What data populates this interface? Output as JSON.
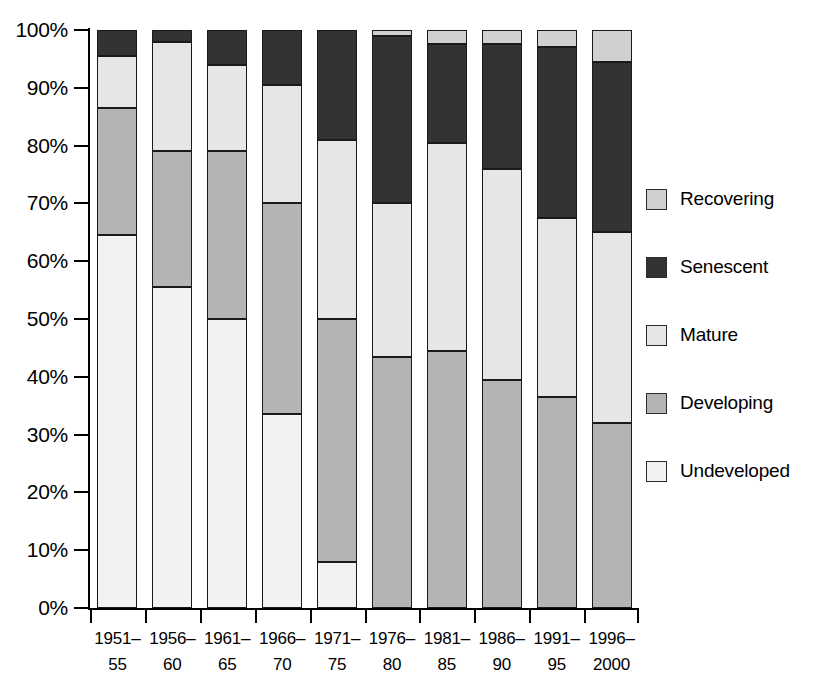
{
  "chart_data": {
    "type": "bar",
    "subtype": "stacked-bar-100-percent",
    "title": "",
    "subtitle": "",
    "xlabel": "",
    "ylabel": "",
    "ylim": [
      0,
      100
    ],
    "y_unit": "%",
    "grid": false,
    "legend_position": "right",
    "categories": [
      "1951-55",
      "1956-60",
      "1961-65",
      "1966-70",
      "1971-75",
      "1976-80",
      "1981-85",
      "1986-90",
      "1991-95",
      "1996-2000"
    ],
    "category_lines": [
      {
        "line1": "1951–",
        "line2": "55"
      },
      {
        "line1": "1956–",
        "line2": "60"
      },
      {
        "line1": "1961–",
        "line2": "65"
      },
      {
        "line1": "1966–",
        "line2": "70"
      },
      {
        "line1": "1971–",
        "line2": "75"
      },
      {
        "line1": "1976–",
        "line2": "80"
      },
      {
        "line1": "1981–",
        "line2": "85"
      },
      {
        "line1": "1986–",
        "line2": "90"
      },
      {
        "line1": "1991–",
        "line2": "95"
      },
      {
        "line1": "1996–",
        "line2": "2000"
      }
    ],
    "y_ticks": [
      "0%",
      "10%",
      "20%",
      "30%",
      "40%",
      "50%",
      "60%",
      "70%",
      "80%",
      "90%",
      "100%"
    ],
    "y_tick_values": [
      0,
      10,
      20,
      30,
      40,
      50,
      60,
      70,
      80,
      90,
      100
    ],
    "stack_order_bottom_to_top": [
      "Undeveloped",
      "Developing",
      "Mature",
      "Senescent",
      "Recovering"
    ],
    "series": [
      {
        "name": "Undeveloped",
        "color": "#f2f2f2",
        "values": [
          64.5,
          55.5,
          50.0,
          33.5,
          8.0,
          0.0,
          0.0,
          0.0,
          0.0,
          0.0
        ]
      },
      {
        "name": "Developing",
        "color": "#b4b4b4",
        "values": [
          22.0,
          23.5,
          29.0,
          36.5,
          42.0,
          43.5,
          44.5,
          39.5,
          36.5,
          32.0
        ]
      },
      {
        "name": "Mature",
        "color": "#e6e6e6",
        "values": [
          9.0,
          19.0,
          15.0,
          20.5,
          31.0,
          26.5,
          36.0,
          36.5,
          31.0,
          33.0
        ]
      },
      {
        "name": "Senescent",
        "color": "#333333",
        "values": [
          4.5,
          2.0,
          6.0,
          9.5,
          19.0,
          29.0,
          17.0,
          21.5,
          29.5,
          29.5
        ]
      },
      {
        "name": "Recovering",
        "color": "#d0d0d0",
        "values": [
          0.0,
          0.0,
          0.0,
          0.0,
          0.0,
          1.0,
          2.5,
          2.5,
          3.0,
          5.5
        ]
      }
    ],
    "cumulative_tops_bottom_to_top": [
      {
        "category": "1951-55",
        "Undeveloped": 64.5,
        "Developing": 86.5,
        "Mature": 95.5,
        "Senescent": 100.0,
        "Recovering": 100.0
      },
      {
        "category": "1956-60",
        "Undeveloped": 55.5,
        "Developing": 79.0,
        "Mature": 98.0,
        "Senescent": 100.0,
        "Recovering": 100.0
      },
      {
        "category": "1961-65",
        "Undeveloped": 50.0,
        "Developing": 79.0,
        "Mature": 94.0,
        "Senescent": 100.0,
        "Recovering": 100.0
      },
      {
        "category": "1966-70",
        "Undeveloped": 33.5,
        "Developing": 70.0,
        "Mature": 90.5,
        "Senescent": 100.0,
        "Recovering": 100.0
      },
      {
        "category": "1971-75",
        "Undeveloped": 8.0,
        "Developing": 50.0,
        "Mature": 81.0,
        "Senescent": 100.0,
        "Recovering": 100.0
      },
      {
        "category": "1976-80",
        "Undeveloped": 0.0,
        "Developing": 43.5,
        "Mature": 70.0,
        "Senescent": 99.0,
        "Recovering": 100.0
      },
      {
        "category": "1981-85",
        "Undeveloped": 0.0,
        "Developing": 44.5,
        "Mature": 80.5,
        "Senescent": 97.5,
        "Recovering": 100.0
      },
      {
        "category": "1986-90",
        "Undeveloped": 0.0,
        "Developing": 39.5,
        "Mature": 76.0,
        "Senescent": 97.5,
        "Recovering": 100.0
      },
      {
        "category": "1991-95",
        "Undeveloped": 0.0,
        "Developing": 36.5,
        "Mature": 67.5,
        "Senescent": 97.0,
        "Recovering": 100.0
      },
      {
        "category": "1996-2000",
        "Undeveloped": 0.0,
        "Developing": 32.0,
        "Mature": 65.0,
        "Senescent": 94.5,
        "Recovering": 100.0
      }
    ]
  },
  "legend": {
    "entries": [
      {
        "label": "Recovering",
        "color": "#d0d0d0"
      },
      {
        "label": "Senescent",
        "color": "#333333"
      },
      {
        "label": "Mature",
        "color": "#e6e6e6"
      },
      {
        "label": "Developing",
        "color": "#b4b4b4"
      },
      {
        "label": "Undeveloped",
        "color": "#f2f2f2"
      }
    ]
  },
  "colors": {
    "axis": "#000000",
    "segment_border": "#1a1a1a",
    "background": "#ffffff"
  }
}
